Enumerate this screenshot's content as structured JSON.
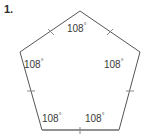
{
  "figure": {
    "problem_number": "1.",
    "shape_name": "regular-pentagon",
    "stroke_color": "#555555",
    "base_stroke_color": "#808080",
    "label_color": "#3a3a3a",
    "background_color": "#ffffff",
    "vertices": [
      {
        "name": "top",
        "x": 80,
        "y": 11
      },
      {
        "name": "right",
        "x": 140,
        "y": 52
      },
      {
        "name": "bottom-right",
        "x": 119,
        "y": 130
      },
      {
        "name": "bottom-left",
        "x": 42,
        "y": 130
      },
      {
        "name": "left",
        "x": 20,
        "y": 52
      }
    ],
    "tick_marks": [
      {
        "name": "tick-top-left-edge",
        "x": 51,
        "y": 32
      },
      {
        "name": "tick-top-right-edge",
        "x": 110,
        "y": 32
      },
      {
        "name": "tick-left-edge",
        "x": 31,
        "y": 91
      },
      {
        "name": "tick-bottom-edge",
        "x": 80,
        "y": 130
      },
      {
        "name": "tick-right-edge",
        "x": 130,
        "y": 91
      }
    ],
    "angle_value": "108",
    "degree_symbol": "°",
    "angles": [
      {
        "name": "angle-top",
        "value": "108",
        "unit": "°"
      },
      {
        "name": "angle-left",
        "value": "108",
        "unit": "°"
      },
      {
        "name": "angle-right",
        "value": "108",
        "unit": "°"
      },
      {
        "name": "angle-bottom-left",
        "value": "108",
        "unit": "°"
      },
      {
        "name": "angle-bottom-right",
        "value": "108",
        "unit": "°"
      }
    ]
  }
}
